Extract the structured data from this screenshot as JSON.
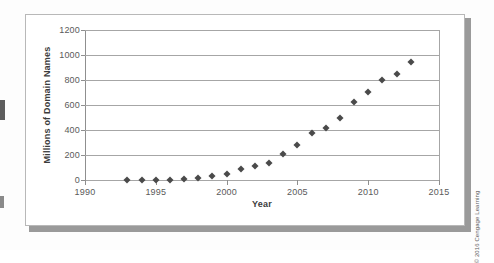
{
  "figure": {
    "credit": "© 2016 Cengage Learning"
  },
  "chart_data": {
    "type": "scatter",
    "title": "",
    "xlabel": "Year",
    "ylabel": "Millions of Domain Names",
    "xlim": [
      1990,
      2015
    ],
    "ylim": [
      0,
      1200
    ],
    "grid": true,
    "legend": false,
    "xticks": [
      "1990",
      "1995",
      "2000",
      "2005",
      "2010",
      "2015"
    ],
    "xtick_values": [
      1990,
      1995,
      2000,
      2005,
      2010,
      2015
    ],
    "yticks": [
      "0",
      "200",
      "400",
      "600",
      "800",
      "1000",
      "1200"
    ],
    "ytick_values": [
      0,
      200,
      400,
      600,
      800,
      1000,
      1200
    ],
    "x": [
      1993,
      1994,
      1995,
      1996,
      1997,
      1998,
      1999,
      2000,
      2001,
      2002,
      2003,
      2004,
      2005,
      2006,
      2007,
      2008,
      2009,
      2010,
      2011,
      2012,
      2013
    ],
    "values": [
      1,
      2,
      3,
      4,
      8,
      20,
      35,
      50,
      90,
      112,
      136,
      208,
      280,
      376,
      416,
      496,
      624,
      704,
      800,
      848,
      944
    ],
    "marker": "diamond",
    "marker_color": "#4a4a4a"
  }
}
